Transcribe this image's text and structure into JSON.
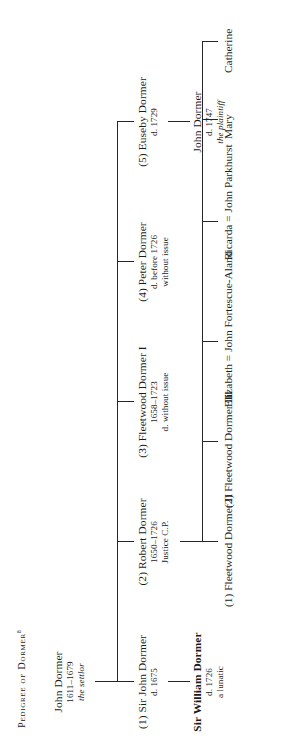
{
  "document": {
    "title_text": "Pedigree of Dormer",
    "title_footnote": "8",
    "orientation": "rotated-90-ccw",
    "ink_color": "#262626"
  },
  "tree": {
    "root": {
      "name": "John Dormer",
      "dates": "1611–1679",
      "note": "the settlor"
    },
    "children": [
      {
        "name": "(1) Sir John Dormer",
        "dates": "d. 1675",
        "note": ""
      },
      {
        "name": "(2) Robert Dormer",
        "dates": "1650–1726",
        "note": "Justice C.P."
      },
      {
        "name": "(3) Fleetwood Dormer I",
        "dates": "1658–1723",
        "note": "d. without issue"
      },
      {
        "name": "(4) Peter Dormer",
        "dates": "d. before 1726",
        "note": "without issue"
      },
      {
        "name": "(5) Euseby Dormer",
        "dates": "d. 1729",
        "note": ""
      }
    ],
    "son_of_john_dormer_1": {
      "name": "Sir William Dormer",
      "dates": "d. 1726",
      "note": "a lunatic"
    },
    "son_of_euseby": {
      "name": "John Dormer",
      "dates": "d. 1747",
      "note": "the plaintiff"
    },
    "grandchildren": [
      {
        "label": "(1) Fleetwood Dormer II"
      },
      {
        "label": "(2) Fleetwood Dormer III"
      },
      {
        "label": "Elizabeth = John Fortescue-Aland"
      },
      {
        "label": "Ricarda = John Parkhurst"
      },
      {
        "label": "Mary"
      },
      {
        "label": "Catherine"
      }
    ]
  }
}
